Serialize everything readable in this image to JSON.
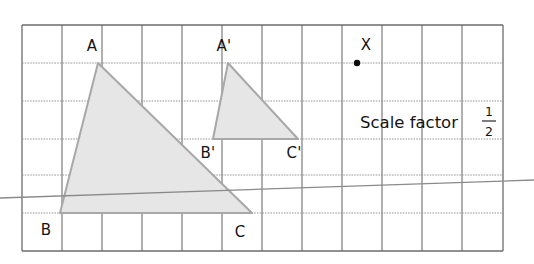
{
  "figure": {
    "background_color": "#ffffff",
    "grid": {
      "line_color": "#8c8c8c",
      "major_line_color": "#6f6f6f",
      "border_color": "#6b6b6b",
      "left": 22,
      "top": 25,
      "right": 503,
      "bottom": 251,
      "columns": 12,
      "rows": 6,
      "cell_width": 40.1,
      "cell_height": 37.7,
      "x_lines": [
        22,
        62,
        102,
        142,
        182,
        222,
        262,
        302,
        342,
        382,
        422,
        462,
        503
      ],
      "y_lines": [
        25,
        63,
        101,
        139,
        175,
        213,
        251
      ]
    },
    "shapes": [
      {
        "name": "triangle-abc",
        "fill": "#e6e6e6",
        "stroke": "#a8a8a8",
        "points": "98,63 60,213 252,213",
        "vertices": [
          {
            "name": "A",
            "x": 98,
            "y": 63
          },
          {
            "name": "B",
            "x": 60,
            "y": 213
          },
          {
            "name": "C",
            "x": 252,
            "y": 213
          }
        ]
      },
      {
        "name": "triangle-a-prime-b-prime-c-prime",
        "fill": "#e6e6e6",
        "stroke": "#a8a8a8",
        "points": "228,63 213,139 298,139",
        "vertices": [
          {
            "name": "A'",
            "x": 228,
            "y": 63
          },
          {
            "name": "B'",
            "x": 213,
            "y": 139
          },
          {
            "name": "C'",
            "x": 298,
            "y": 139
          }
        ]
      }
    ],
    "labels": [
      {
        "name": "label-a",
        "text": "A",
        "x": 92,
        "y": 51,
        "anchor": "middle"
      },
      {
        "name": "label-b",
        "text": "B",
        "x": 46,
        "y": 235,
        "anchor": "middle"
      },
      {
        "name": "label-c",
        "text": "C",
        "x": 240,
        "y": 237,
        "anchor": "middle"
      },
      {
        "name": "label-a-prime",
        "text": "A'",
        "x": 224,
        "y": 51,
        "anchor": "middle"
      },
      {
        "name": "label-b-prime",
        "text": "B'",
        "x": 208,
        "y": 158,
        "anchor": "middle"
      },
      {
        "name": "label-c-prime",
        "text": "C'",
        "x": 294,
        "y": 158,
        "anchor": "middle"
      },
      {
        "name": "label-x",
        "text": "X",
        "x": 366,
        "y": 50,
        "anchor": "middle"
      }
    ],
    "centre_point": {
      "name": "centre-of-enlargement-x",
      "label": "X",
      "x": 357,
      "y": 63,
      "radius": 3.2,
      "color": "#0d0d0d"
    },
    "ray": {
      "name": "ray-through-shapes",
      "x1": 0,
      "y1": 198,
      "x2": 534,
      "y2": 180,
      "color": "#8a8a8a"
    },
    "annotation": {
      "name": "scale-factor-note",
      "text": "Scale factor",
      "x": 360,
      "y": 128,
      "fraction": {
        "numerator": "1",
        "denominator": "2",
        "x": 489,
        "top_y": 116,
        "bar_y": 121,
        "bottom_y": 136
      }
    }
  }
}
